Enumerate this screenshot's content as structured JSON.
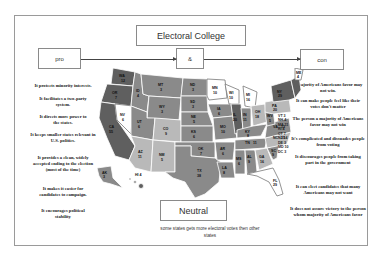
{
  "diagram": {
    "title": "Electoral College",
    "pro_label": "pro",
    "center_label": "&",
    "con_label": "con",
    "neutral_label": "Neutral",
    "neutral_note": "some states gets more electoral votes then other states"
  },
  "pro_points": [
    "It protects minority interests.",
    "It facilitates a two-party system.",
    "It directs more power to the states.",
    "It keeps smaller states relevant in U.S. politics.",
    "It provides a clean, widely accepted ending to the election (most of the time)",
    "It makes it easier for candidates to campaign.",
    "It encourages political stability"
  ],
  "con_points": [
    "a majority of Americans favor may not win.",
    "It can make people feel like their votes don't matter",
    "The person a majority of Americans favor may not win",
    "It's complicated and dissuades people from voting",
    "It discourages people from taking part in the government",
    "It can elect candidates that many Americans may not want",
    "It does not assure victory to the person whom majority of Americans favor"
  ],
  "map": {
    "colors": {
      "dark": "#5f5f5f",
      "mid": "#8a8a8a",
      "light": "#b9b9b9",
      "white": "#ffffff",
      "stroke": "#ffffff"
    },
    "northeast_list": [
      "VT 3",
      "NH 4",
      "MA 11",
      "RI 4",
      "CT 7",
      "NJ 14",
      "DE 3",
      "MD 10",
      "DC 3"
    ],
    "states": [
      {
        "abbr": "WA",
        "ev": "12"
      },
      {
        "abbr": "OR",
        "ev": "7"
      },
      {
        "abbr": "CA",
        "ev": "55"
      },
      {
        "abbr": "NV",
        "ev": "6"
      },
      {
        "abbr": "ID",
        "ev": "4"
      },
      {
        "abbr": "MT",
        "ev": "3"
      },
      {
        "abbr": "WY",
        "ev": "3"
      },
      {
        "abbr": "UT",
        "ev": "6"
      },
      {
        "abbr": "CO",
        "ev": "9"
      },
      {
        "abbr": "AZ",
        "ev": "11"
      },
      {
        "abbr": "NM",
        "ev": "5"
      },
      {
        "abbr": "ND",
        "ev": "3"
      },
      {
        "abbr": "SD",
        "ev": "3"
      },
      {
        "abbr": "NE",
        "ev": "5"
      },
      {
        "abbr": "KS",
        "ev": "6"
      },
      {
        "abbr": "OK",
        "ev": "7"
      },
      {
        "abbr": "TX",
        "ev": "38"
      },
      {
        "abbr": "MN",
        "ev": "10"
      },
      {
        "abbr": "IA",
        "ev": "6"
      },
      {
        "abbr": "MO",
        "ev": "10"
      },
      {
        "abbr": "AR",
        "ev": "6"
      },
      {
        "abbr": "LA",
        "ev": "8"
      },
      {
        "abbr": "WI",
        "ev": "10"
      },
      {
        "abbr": "IL",
        "ev": "20"
      },
      {
        "abbr": "MI",
        "ev": "16"
      },
      {
        "abbr": "IN",
        "ev": "11"
      },
      {
        "abbr": "OH",
        "ev": "18"
      },
      {
        "abbr": "KY",
        "ev": "8"
      },
      {
        "abbr": "TN",
        "ev": "11"
      },
      {
        "abbr": "MS",
        "ev": "6"
      },
      {
        "abbr": "AL",
        "ev": "9"
      },
      {
        "abbr": "GA",
        "ev": "16"
      },
      {
        "abbr": "FL",
        "ev": "29"
      },
      {
        "abbr": "SC",
        "ev": "9"
      },
      {
        "abbr": "NC",
        "ev": "15"
      },
      {
        "abbr": "VA",
        "ev": "13"
      },
      {
        "abbr": "WV",
        "ev": "5"
      },
      {
        "abbr": "PA",
        "ev": "20"
      },
      {
        "abbr": "NY",
        "ev": "29"
      },
      {
        "abbr": "ME",
        "ev": "4"
      },
      {
        "abbr": "AK",
        "ev": "3"
      },
      {
        "abbr": "HI",
        "ev": "4"
      }
    ]
  }
}
